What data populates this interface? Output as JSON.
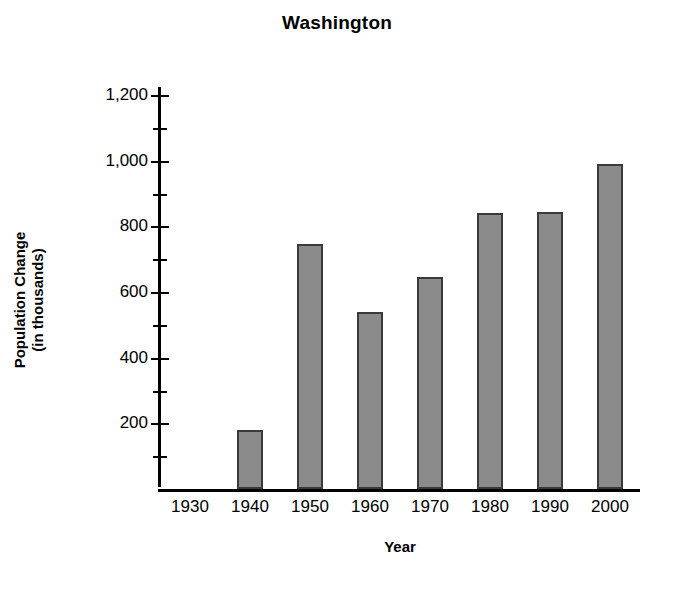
{
  "chart_data": {
    "type": "bar",
    "title": "Washington",
    "xlabel": "Year",
    "ylabel": "Population Change (in thousands)",
    "ylabel_line1": "Population Change",
    "ylabel_line2": "(in thousands)",
    "categories": [
      "1930",
      "1940",
      "1950",
      "1960",
      "1970",
      "1980",
      "1990",
      "2000"
    ],
    "values": [
      null,
      180,
      745,
      540,
      645,
      840,
      845,
      990
    ],
    "ytick_labels": [
      "200",
      "400",
      "600",
      "800",
      "1,000",
      "1,200"
    ],
    "ytick_values": [
      200,
      400,
      600,
      800,
      1000,
      1200
    ],
    "yminor_values": [
      100,
      300,
      500,
      700,
      900,
      1100
    ],
    "ylim": [
      0,
      1200
    ],
    "grid": false,
    "legend": false,
    "bar_color": "#8b8b8b",
    "bar_edge_color": "#3a3a3a",
    "axis_color": "#000000",
    "background": "#ffffff"
  }
}
